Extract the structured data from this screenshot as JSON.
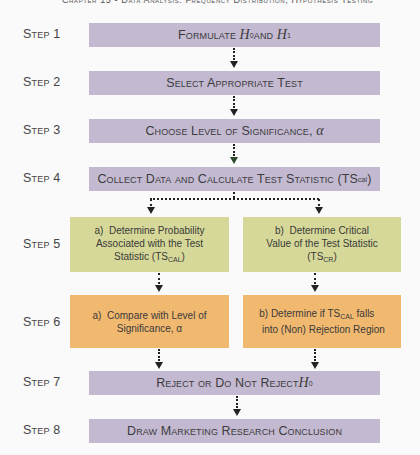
{
  "header": {
    "text": "Chapter 15 • Data Analysis: Frequency Distribution, Hypothesis Testing"
  },
  "steps": [
    {
      "label": "Step 1",
      "text": "Formulate H₀ and H₁",
      "color": "#c3b9d1"
    },
    {
      "label": "Step 2",
      "text": "Select Appropriate Test",
      "color": "#c3b9d1"
    },
    {
      "label": "Step 3",
      "text": "Choose Level of Significance, α",
      "color": "#c3b9d1"
    },
    {
      "label": "Step 4",
      "text": "Collect Data and Calculate Test Statistic (TS_CAL)",
      "color": "#c3b9d1"
    },
    {
      "label": "Step 5",
      "a": {
        "prefix": "a)",
        "line1": "Determine Probability",
        "line2": "Associated with the Test",
        "line3": "Statistic (TS",
        "sub": "CAL",
        "suffix": ")"
      },
      "b": {
        "prefix": "b)",
        "line1": "Determine Critical",
        "line2": "Value of the Test Statistic",
        "line3": "(TS",
        "sub": "CR",
        "suffix": ")"
      },
      "color": "#d5d898"
    },
    {
      "label": "Step 6",
      "a": {
        "prefix": "a)",
        "line1": "Compare with Level of",
        "line2": "Significance, α"
      },
      "b": {
        "prefix": "b)",
        "line1": "Determine if TS",
        "sub": "CAL",
        "line1_suffix": " falls",
        "line2": "into (Non) Rejection Region"
      },
      "color": "#f1b870"
    },
    {
      "label": "Step 7",
      "text": "Reject or Do Not Reject H₀",
      "color": "#c3b9d1"
    },
    {
      "label": "Step 8",
      "text": "Draw Marketing Research Conclusion",
      "color": "#c3b9d1"
    }
  ],
  "parts": {
    "s1_pre": "Formulate ",
    "s1_h": "H",
    "s1_sub0": "0",
    "s1_and": " and ",
    "s1_sub1": "1",
    "s3_text": "Choose Level of Significance, ",
    "alpha": "α",
    "s4_text": "Collect Data and Calculate Test Statistic (TS",
    "s4_sub": "cal",
    "s4_close": ")",
    "s7_text": "Reject or Do Not Reject ",
    "s7_sub": "0"
  }
}
